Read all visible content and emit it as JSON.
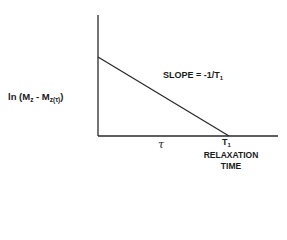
{
  "diagram": {
    "type": "semi-log relaxation plot",
    "y_axis_label": {
      "prefix": "ln (M",
      "sub1": "z",
      "middle": " - M",
      "sub2": "z(τ)",
      "suffix": ")"
    },
    "slope_label": {
      "text": "SLOPE = -1/T",
      "sub": "1"
    },
    "x_tick_tau": "τ",
    "x_tick_t1": {
      "text": "T",
      "sub": "1"
    },
    "x_axis_label_line1": "RELAXATION",
    "x_axis_label_line2": "TIME",
    "colors": {
      "axis": "#2a2a2a",
      "line": "#2a2a2a",
      "background": "#ffffff"
    }
  }
}
